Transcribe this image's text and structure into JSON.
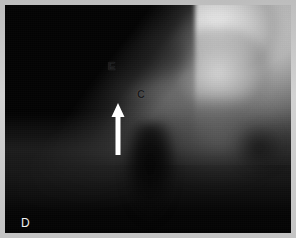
{
  "figure": {
    "panel_label": "D",
    "modality": "grayscale radiograph",
    "frame_color": "#c4c4c4",
    "background_color": "#070707"
  },
  "annotations": {
    "eminence": {
      "label": "E",
      "meaning": "articular-eminence-label",
      "color": "#1b1b1b",
      "x": 103,
      "y": 56
    },
    "condyle": {
      "label": "C",
      "meaning": "condyle-label",
      "color": "#1b1b1b",
      "x": 132,
      "y": 84
    },
    "panel": {
      "label": "D",
      "meaning": "panel-letter",
      "color": "#f2f2f2",
      "x": 16,
      "y": 212
    },
    "arrow": {
      "name": "up-arrow-pointer",
      "color": "#ffffff",
      "direction": "up",
      "tip_x": 113,
      "tip_y": 99,
      "tail_y": 150
    }
  }
}
